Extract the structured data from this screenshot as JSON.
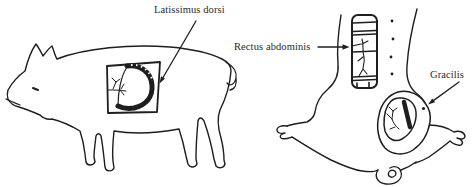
{
  "figure": {
    "background_color": "#ffffff",
    "ink_color": "#1e1e1e",
    "text_color": "#2b2b2b",
    "labels": {
      "latissimus_dorsi": "Latissimus dorsi",
      "rectus_abdominis": "Rectus abdominis",
      "gracilis": "Gracilis"
    }
  }
}
